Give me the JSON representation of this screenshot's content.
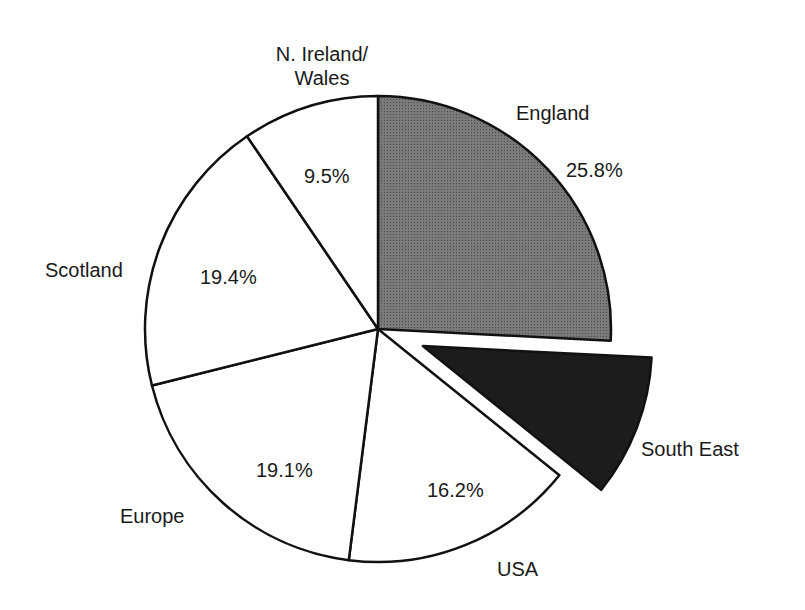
{
  "chart_data": {
    "type": "pie",
    "title": "",
    "unit": "%",
    "slices": [
      {
        "name": "England",
        "value": 25.8,
        "label": "25.8%",
        "fill": "#6e6e6e",
        "exploded": false
      },
      {
        "name": "South East",
        "value": 10.0,
        "label": "",
        "fill": "#1c1c1c",
        "exploded": true,
        "value_estimated": true
      },
      {
        "name": "USA",
        "value": 16.2,
        "label": "16.2%",
        "fill": "#ffffff",
        "exploded": false
      },
      {
        "name": "Europe",
        "value": 19.1,
        "label": "19.1%",
        "fill": "#ffffff",
        "exploded": false
      },
      {
        "name": "Scotland",
        "value": 19.4,
        "label": "19.4%",
        "fill": "#ffffff",
        "exploded": false
      },
      {
        "name": "N. Ireland/Wales",
        "value": 9.5,
        "label": "9.5%",
        "fill": "#ffffff",
        "exploded": false
      }
    ],
    "start_angle": "12 o'clock",
    "direction": "clockwise",
    "legend": "none (direct labels)"
  },
  "labels": {
    "england": "England",
    "england_pct": "25.8%",
    "south_east": "South East",
    "usa": "USA",
    "usa_pct": "16.2%",
    "europe": "Europe",
    "europe_pct": "19.1%",
    "scotland": "Scotland",
    "scotland_pct": "19.4%",
    "ni_wales_line1": "N. Ireland/",
    "ni_wales_line2": "Wales",
    "ni_wales_pct": "9.5%"
  }
}
